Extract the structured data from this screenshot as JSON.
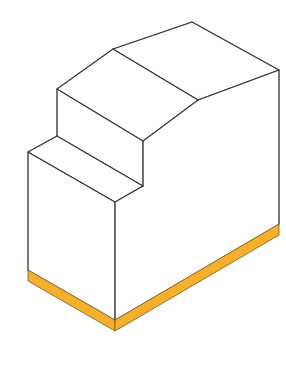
{
  "diagram": {
    "colors": {
      "background": "#ffffff",
      "face": "#ffffff",
      "edge": "#3a3a3a",
      "base": "#f4b02a",
      "base_edge": "#7a5a1a"
    },
    "faces": [
      {
        "name": "top-back-face",
        "points": "113,49 192,22 279,70 198,100"
      },
      {
        "name": "upper-step-top-face",
        "points": "57,89 113,49 198,100 143,141"
      },
      {
        "name": "upper-step-riser-face",
        "points": "57,89 143,141 143,186 57,136"
      },
      {
        "name": "lower-step-top-face",
        "points": "28,152 57,136 143,186 115,202"
      },
      {
        "name": "front-left-face",
        "points": "28,152 115,202 115,320 28,270"
      },
      {
        "name": "right-side-face",
        "points": "115,202 143,186 143,141 198,100 279,70 279,224 115,320"
      }
    ],
    "base": [
      {
        "name": "base-left-strip",
        "points": "28,270 115,320 115,331 28,281"
      },
      {
        "name": "base-right-strip",
        "points": "115,320 279,224 279,235 115,331"
      }
    ],
    "edges": [
      {
        "name": "edge-ridge-left",
        "d": "M113,49 L192,22"
      },
      {
        "name": "edge-back-top",
        "d": "M192,22 L279,70"
      },
      {
        "name": "edge-mid-ridge",
        "d": "M113,49 L198,100"
      },
      {
        "name": "edge-right-top",
        "d": "M198,100 L279,70"
      },
      {
        "name": "edge-upper-step-left",
        "d": "M57,89 L113,49"
      },
      {
        "name": "edge-upper-step-front",
        "d": "M57,89 L143,141"
      },
      {
        "name": "edge-upper-slope",
        "d": "M143,141 L198,100"
      },
      {
        "name": "edge-upper-riser-left",
        "d": "M57,89 L57,136"
      },
      {
        "name": "edge-upper-riser-right",
        "d": "M143,141 L143,186"
      },
      {
        "name": "edge-lower-step-back",
        "d": "M57,136 L143,186"
      },
      {
        "name": "edge-lower-step-left",
        "d": "M57,136 L28,152"
      },
      {
        "name": "edge-lower-step-front",
        "d": "M28,152 L115,202"
      },
      {
        "name": "edge-lower-step-right",
        "d": "M115,202 L143,186"
      },
      {
        "name": "edge-front-left-vertical",
        "d": "M28,152 L28,270"
      },
      {
        "name": "edge-front-corner-vertical",
        "d": "M115,202 L115,320"
      },
      {
        "name": "edge-right-vertical",
        "d": "M279,70 L279,224"
      }
    ]
  }
}
